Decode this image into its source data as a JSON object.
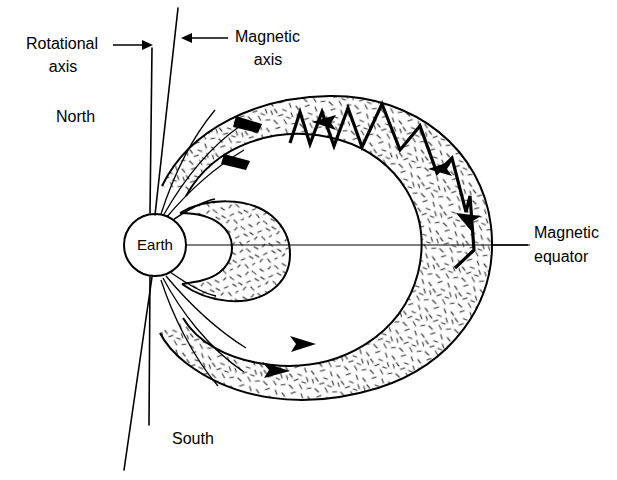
{
  "figure": {
    "background_color": "#ffffff",
    "ink_color": "#000000"
  },
  "labels": {
    "rotational_axis_line1": "Rotational",
    "rotational_axis_line2": "axis",
    "magnetic_axis_line1": "Magnetic",
    "magnetic_axis_line2": "axis",
    "north": "North",
    "south": "South",
    "earth": "Earth",
    "magnetic_equator_line1": "Magnetic",
    "magnetic_equator_line2": "equator"
  },
  "icons": {
    "rotational_axis_pointer": "arrow-right-icon",
    "magnetic_axis_pointer": "arrow-left-icon",
    "belt_flow_top": "arrow-left-icon",
    "belt_flow_bottom": "arrow-right-icon",
    "trajectory_direction": "arrow-left-icon"
  },
  "diagram_elements": {
    "earth": {
      "cx": 155,
      "cy": 245,
      "r": 31
    },
    "rotational_axis": {
      "top": [
        152,
        48
      ],
      "bottom": [
        150,
        425
      ],
      "tilt_deg": 0
    },
    "magnetic_axis": {
      "top": [
        178,
        8
      ],
      "bottom": [
        124,
        470
      ],
      "tilt_deg": 7
    },
    "magnetic_equator": {
      "y": 245,
      "x_from": 155,
      "x_to": 530
    },
    "inner_belt": {
      "description": "kidney-shaped inner radiation belt",
      "x_extent": [
        178,
        285
      ]
    },
    "outer_belt": {
      "description": "large crescent outer radiation belt",
      "x_extent": [
        165,
        492
      ]
    },
    "particle_trajectory": {
      "description": "bouncing spiral particle path along field line",
      "direction": "westward drift"
    }
  },
  "arrow_counts": {
    "top_belt_arrows": 2,
    "bottom_belt_arrows": 2,
    "trajectory_arrows": 3
  }
}
